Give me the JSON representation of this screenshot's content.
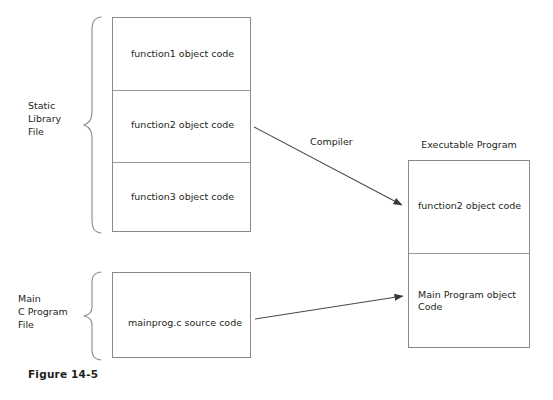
{
  "figure": {
    "caption": "Figure 14-5"
  },
  "groups": {
    "static_library": {
      "label": "Static\nLibrary\nFile",
      "brace_name": "curly-brace-icon"
    },
    "main_c_program": {
      "label": "Main\nC Program\nFile",
      "brace_name": "curly-brace-icon"
    }
  },
  "static_library_box": {
    "cells": [
      {
        "text": "function1 object code"
      },
      {
        "text": "function2 object code"
      },
      {
        "text": "function3 object code"
      }
    ]
  },
  "main_program_box": {
    "cells": [
      {
        "text": "mainprog.c source code"
      }
    ]
  },
  "executable_box": {
    "title": "Executable Program",
    "cells": [
      {
        "text": "function2 object code"
      },
      {
        "text": "Main Program object\nCode"
      }
    ]
  },
  "arrows": [
    {
      "name": "compiler-arrow",
      "label": "Compiler",
      "from": "function2 object code",
      "to": "function2 object code"
    },
    {
      "name": "link-arrow",
      "label": "",
      "from": "mainprog.c source code",
      "to": "Main Program object Code"
    }
  ],
  "colors": {
    "background": "#ffffff",
    "stroke": "#8a8a8a",
    "text": "#231f20",
    "arrow": "#3a3a3a"
  }
}
